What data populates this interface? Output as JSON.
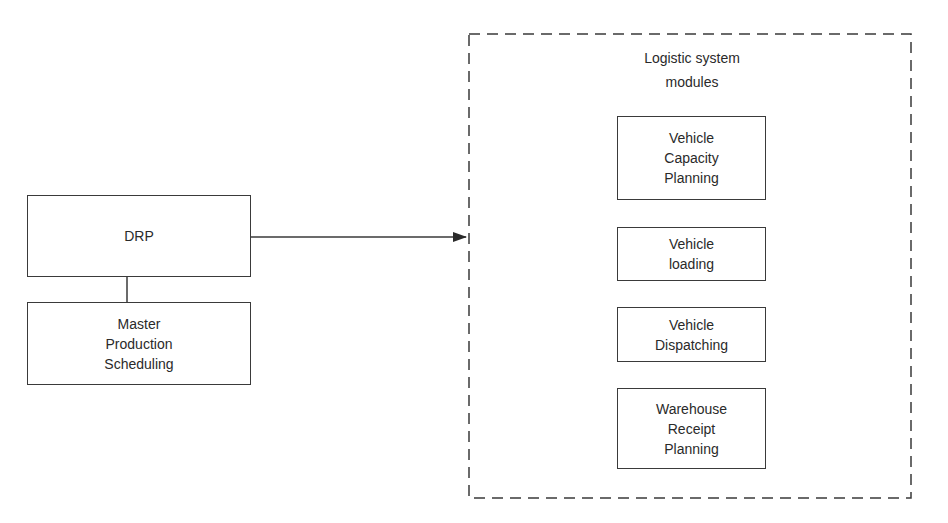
{
  "diagram": {
    "left": {
      "drp": {
        "label": "DRP"
      },
      "mps": {
        "label": "Master\nProduction\nScheduling"
      }
    },
    "group": {
      "title": "Logistic system\nmodules",
      "modules": [
        {
          "label": "Vehicle\nCapacity\nPlanning"
        },
        {
          "label": "Vehicle\nloading"
        },
        {
          "label": "Vehicle\nDispatching"
        },
        {
          "label": "Warehouse\nReceipt\nPlanning"
        }
      ]
    },
    "colors": {
      "line": "#3a3a3a",
      "text": "#2a2a2a",
      "background": "#ffffff"
    }
  }
}
